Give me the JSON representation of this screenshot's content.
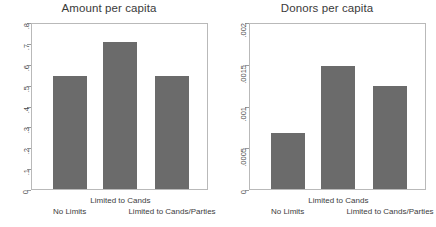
{
  "figure": {
    "width": 436,
    "height": 227,
    "background": "#ffffff",
    "bar_color": "#6b6b6b",
    "frame_color": "#b9b9b9",
    "text_color": "#3a3a3a"
  },
  "chart_data": [
    {
      "type": "bar",
      "title": "Amount per capita",
      "xlabel": "",
      "ylabel": "",
      "categories": [
        "No Limits",
        "Limited to Cands",
        "Limited to Cands/Parties"
      ],
      "values": [
        0.55,
        0.715,
        0.55
      ],
      "ylim": [
        0,
        0.8
      ],
      "yticks": [
        0,
        0.1,
        0.2,
        0.3,
        0.4,
        0.5,
        0.6,
        0.7,
        0.8
      ],
      "ytick_labels": [
        "0",
        ".1",
        ".2",
        ".3",
        ".4",
        ".5",
        ".6",
        ".7",
        ".8"
      ],
      "grid": false,
      "legend": "none",
      "tick_label_rotation": 90
    },
    {
      "type": "bar",
      "title": "Donors per capita",
      "xlabel": "",
      "ylabel": "",
      "categories": [
        "No Limits",
        "Limited to Cands",
        "Limited to Cands/Parties"
      ],
      "values": [
        0.00068,
        0.00149,
        0.00125
      ],
      "ylim": [
        0,
        0.002
      ],
      "yticks": [
        0,
        0.0005,
        0.001,
        0.0015,
        0.002
      ],
      "ytick_labels": [
        "0",
        ".0005",
        ".001",
        ".0015",
        ".002"
      ],
      "grid": false,
      "legend": "none",
      "tick_label_rotation": 90
    }
  ]
}
